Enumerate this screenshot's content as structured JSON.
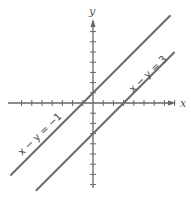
{
  "axes": {
    "x_label": "x",
    "y_label": "y",
    "origin_px": [
      93,
      103
    ],
    "unit_px": 10.2,
    "x_ticks": [
      -7,
      -6,
      -5,
      -4,
      -3,
      -2,
      -1,
      1,
      2,
      3,
      4,
      5,
      6,
      7,
      8
    ],
    "y_ticks": [
      -8,
      -7,
      -6,
      -5,
      -4,
      -3,
      -2,
      -1,
      1,
      2,
      3,
      4,
      5,
      6,
      7
    ],
    "axis_color": "#666666"
  },
  "lines": [
    {
      "equation": "x − y = −1",
      "slope": 1,
      "intercept": 1,
      "x_range": [
        -8.1,
        7.6
      ],
      "color": "#6b6b6b"
    },
    {
      "equation": "x − y = 3",
      "slope": 1,
      "intercept": -3,
      "x_range": [
        -5.6,
        8.0
      ],
      "color": "#6b6b6b"
    }
  ],
  "labels": {
    "line1": "x − y = −1",
    "line2": "x − y = 3"
  }
}
